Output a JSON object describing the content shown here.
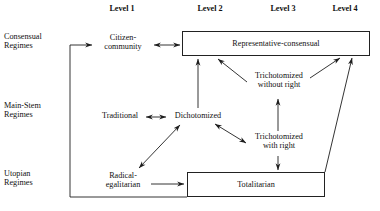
{
  "figure": {
    "type": "diagram",
    "title": "",
    "kind": "regime-typology-flow-diagram"
  },
  "columns": [
    {
      "id": "level1",
      "label": "Level 1",
      "x": 122
    },
    {
      "id": "level2",
      "label": "Level 2",
      "x": 210
    },
    {
      "id": "level3",
      "label": "Level 3",
      "x": 283
    },
    {
      "id": "level4",
      "label": "Level 4",
      "x": 345
    }
  ],
  "rows": [
    {
      "id": "consensual",
      "line1": "Consensual",
      "line2": "Regimes",
      "y": 36
    },
    {
      "id": "main-stem",
      "line1": "Main-Stem",
      "line2": "Regimes",
      "y": 106
    },
    {
      "id": "utopian",
      "line1": "Utopian",
      "line2": "Regimes",
      "y": 172
    }
  ],
  "nodes": [
    {
      "id": "citizen-community",
      "kind": "text",
      "line1": "Citizen-",
      "line2": "community",
      "x": 99,
      "y": 34,
      "w": 50,
      "h": 22
    },
    {
      "id": "representative-consensual",
      "kind": "box",
      "label": "Representative-consensual",
      "x": 182,
      "y": 31,
      "w": 188,
      "h": 24
    },
    {
      "id": "traditional",
      "kind": "text",
      "line1": "Traditional",
      "x": 95,
      "y": 111,
      "w": 48,
      "h": 11
    },
    {
      "id": "dichotomized",
      "kind": "text",
      "line1": "Dichotomized",
      "x": 169,
      "y": 111,
      "w": 58,
      "h": 11
    },
    {
      "id": "trichotomized-without-right",
      "kind": "text",
      "line1": "Trichotomized",
      "line2": "without right",
      "x": 248,
      "y": 72,
      "w": 60,
      "h": 22
    },
    {
      "id": "trichotomized-with-right",
      "kind": "text",
      "line1": "Trichotomized",
      "line2": "with right",
      "x": 248,
      "y": 133,
      "w": 60,
      "h": 22
    },
    {
      "id": "radical-egalitarian",
      "kind": "text",
      "line1": "Radical-",
      "line2": "egalitarian",
      "x": 96,
      "y": 172,
      "w": 52,
      "h": 22
    },
    {
      "id": "totalitarian",
      "kind": "box",
      "label": "Totalitarian",
      "x": 187,
      "y": 172,
      "w": 138,
      "h": 24
    }
  ],
  "edges": [
    {
      "id": "feedback-loop-to-citizen-community",
      "from": "totalitarian-row-left",
      "to": "citizen-community",
      "style": "solid",
      "heads": "single"
    },
    {
      "id": "citizen-community-to-representative-consensual",
      "from": "citizen-community",
      "to": "representative-consensual",
      "style": "solid",
      "heads": "double"
    },
    {
      "id": "dichotomized-to-representative-consensual",
      "from": "dichotomized",
      "to": "representative-consensual",
      "style": "solid",
      "heads": "single"
    },
    {
      "id": "trichotomized-without-right-to-representative-consensual",
      "from": "trichotomized-without-right",
      "to": "representative-consensual",
      "style": "solid",
      "heads": "single"
    },
    {
      "id": "totalitarian-to-representative-consensual",
      "from": "totalitarian",
      "to": "representative-consensual",
      "style": "solid",
      "heads": "single"
    },
    {
      "id": "traditional-to-dichotomized",
      "from": "traditional",
      "to": "dichotomized",
      "style": "solid",
      "heads": "double"
    },
    {
      "id": "radical-egalitarian-to-dichotomized",
      "from": "radical-egalitarian",
      "to": "dichotomized",
      "style": "solid",
      "heads": "double"
    },
    {
      "id": "dichotomized-to-trichotomized-with-right",
      "from": "dichotomized",
      "to": "trichotomized-with-right",
      "style": "solid",
      "heads": "double"
    },
    {
      "id": "trichotomized-with-right-to-without-right",
      "from": "trichotomized-with-right",
      "to": "trichotomized-without-right",
      "style": "solid",
      "heads": "single"
    },
    {
      "id": "trichotomized-with-right-to-totalitarian",
      "from": "trichotomized-with-right",
      "to": "totalitarian",
      "style": "solid",
      "heads": "single"
    },
    {
      "id": "radical-egalitarian-to-totalitarian",
      "from": "radical-egalitarian",
      "to": "totalitarian",
      "style": "solid",
      "heads": "single"
    }
  ],
  "colors": {
    "ink": "#1a1a1a",
    "stroke": "#222222",
    "background": "#ffffff"
  }
}
